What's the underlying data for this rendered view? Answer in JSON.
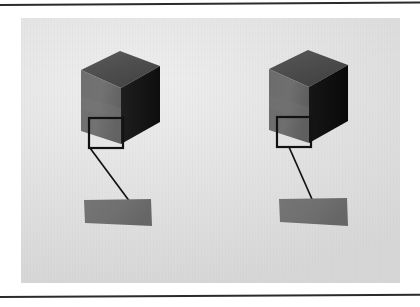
{
  "figure": {
    "panel": {
      "background_color": "#e3e3e3",
      "x": 21,
      "y": 18,
      "width": 379,
      "height": 265
    },
    "page_rules": [
      {
        "name": "top-rule",
        "color": "#2b2b2b"
      },
      {
        "name": "bottom-rule",
        "color": "#2b2b2b"
      }
    ],
    "colors": {
      "cube_top_face": "#4f4f4f",
      "cube_front_face": "#6e6e6e",
      "cube_right_face_left": "#1d1d1d",
      "cube_right_face_right": "#111111",
      "callout_stroke": "#121212",
      "leader_line": "#121212",
      "patch_fill": "#707070",
      "background": "#e3e3e3"
    },
    "objects": [
      {
        "id": "cube-left",
        "label": "left-cube",
        "top_face": {
          "points": "60,52 99,33 139,48 100,70"
        },
        "front_face": {
          "points": "60,52 100,70 100,126 60,113"
        },
        "right_face": {
          "points": "100,70 139,48 139,104 100,126"
        },
        "callout": {
          "x": 68,
          "y": 100,
          "width": 34,
          "height": 30
        },
        "leader": {
          "x1": 69,
          "y1": 130,
          "x2": 112,
          "y2": 188
        },
        "patch": {
          "points": "63,182 130,181 131,208 64,205"
        }
      },
      {
        "id": "cube-right",
        "label": "right-cube",
        "top_face": {
          "points": "248,51 287,32 327,47 288,69"
        },
        "front_face": {
          "points": "248,51 288,69 288,125 248,112"
        },
        "right_face": {
          "points": "288,69 327,47 327,103 288,125"
        },
        "callout": {
          "x": 256,
          "y": 99,
          "width": 34,
          "height": 30
        },
        "leader": {
          "x1": 268,
          "y1": 129,
          "x2": 294,
          "y2": 188
        },
        "patch": {
          "points": "258,181 326,180 327,208 259,204"
        }
      }
    ]
  }
}
